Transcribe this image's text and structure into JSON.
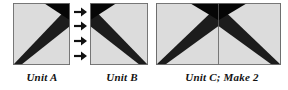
{
  "figure": {
    "kind": "quilt-block-piecing-diagram",
    "background": "#ffffff",
    "colors": {
      "fabric_light": "#d9d9d9",
      "fabric_light_edge": "#e8e8e8",
      "fabric_dark": "#1c1c1c",
      "fabric_black": "#050505",
      "outline": "#6e6e6e",
      "seam_line": "#5a5a5a",
      "arrow": "#111111",
      "caption_text": "#121212"
    },
    "arrows": {
      "name": "right-arrow",
      "glyph": "➔",
      "count": 4,
      "direction": "right",
      "meaning": "join Unit A to Unit B"
    },
    "units": [
      {
        "id": "unit-a",
        "caption": "Unit A",
        "shape": "square",
        "description": "light square with dark wedge from lower-left corner to upper-right, black corner triangle at top right"
      },
      {
        "id": "unit-b",
        "caption": "Unit B",
        "shape": "square",
        "description": "light square with dark wedge from upper-left corner to lower-right, black corner triangle at top left"
      },
      {
        "id": "unit-c",
        "caption": "Unit C; Make 2",
        "shape": "rectangle",
        "description": "Unit A joined to Unit B forming a wide rectangle with a centre seam, dark peak meeting at top centre"
      }
    ]
  }
}
